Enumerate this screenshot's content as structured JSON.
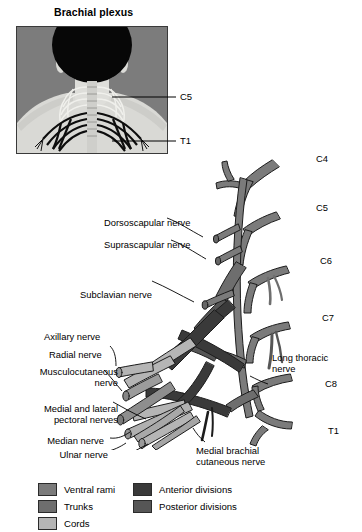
{
  "figure": {
    "title": "Brachial plexus"
  },
  "inset": {
    "name": "brachial-plexus-photo-inset",
    "labels": [
      {
        "id": "c5",
        "text": "C5"
      },
      {
        "id": "t1",
        "text": "T1"
      }
    ]
  },
  "diagram": {
    "root_labels": [
      {
        "id": "c4",
        "text": "C4"
      },
      {
        "id": "c5",
        "text": "C5"
      },
      {
        "id": "c6",
        "text": "C6"
      },
      {
        "id": "c7",
        "text": "C7"
      },
      {
        "id": "c8",
        "text": "C8"
      },
      {
        "id": "t1",
        "text": "T1"
      }
    ],
    "nerve_labels": [
      {
        "id": "dorsoscapular",
        "text": "Dorsoscapular nerve"
      },
      {
        "id": "suprascapular",
        "text": "Suprascapular nerve"
      },
      {
        "id": "subclavian",
        "text": "Subclavian nerve"
      },
      {
        "id": "axillary",
        "text": "Axillary nerve"
      },
      {
        "id": "radial",
        "text": "Radial nerve"
      },
      {
        "id": "musculocutaneous_l1",
        "text": "Musculocutaneous"
      },
      {
        "id": "musculocutaneous_l2",
        "text": "nerve"
      },
      {
        "id": "pectoral_l1",
        "text": "Medial and lateral"
      },
      {
        "id": "pectoral_l2",
        "text": "pectoral nerves"
      },
      {
        "id": "median",
        "text": "Median nerve"
      },
      {
        "id": "ulnar",
        "text": "Ulnar nerve"
      },
      {
        "id": "long_thoracic_l1",
        "text": "Long thoracic"
      },
      {
        "id": "long_thoracic_l2",
        "text": "nerve"
      },
      {
        "id": "mbc_l1",
        "text": "Medial brachial"
      },
      {
        "id": "mbc_l2",
        "text": "cutaneous nerve"
      }
    ]
  },
  "legend": {
    "items": [
      {
        "id": "ventral-rami",
        "label": "Ventral rami",
        "color": "#7b7b7b"
      },
      {
        "id": "trunks",
        "label": "Trunks",
        "color": "#6e6e6e"
      },
      {
        "id": "cords",
        "label": "Cords",
        "color": "#b5b5b5"
      },
      {
        "id": "anterior-divisions",
        "label": "Anterior divisions",
        "color": "#3a3a3a"
      },
      {
        "id": "posterior-divisions",
        "label": "Posterior divisions",
        "color": "#565656"
      }
    ]
  },
  "colors": {
    "ventral_rami": "#7b7b7b",
    "trunks": "#6e6e6e",
    "cords": "#b5b5b5",
    "anterior_divisions": "#3a3a3a",
    "posterior_divisions": "#565656",
    "outline": "#1c1c1c",
    "inset_bg": "#7c7c7c",
    "skin": "#d8d8d4",
    "hair": "#080808"
  }
}
